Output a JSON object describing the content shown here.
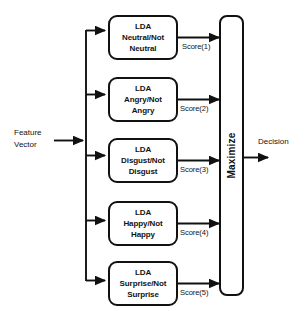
{
  "diagram": {
    "background_color": "#ffffff",
    "line_color": "#111111",
    "text_color": "#131313",
    "input": {
      "label_line1": "Feature",
      "label_line2": "Vector"
    },
    "classifiers": [
      {
        "name": "lda-neutral",
        "line1": "LDA",
        "line2": "Neutral/Not",
        "line3": "Neutral",
        "score_label": "Score(1)"
      },
      {
        "name": "lda-angry",
        "line1": "LDA",
        "line2": "Angry/Not",
        "line3": "Angry",
        "score_label": "Score(2)"
      },
      {
        "name": "lda-disgust",
        "line1": "LDA",
        "line2": "Disgust/Not",
        "line3": "Disgust",
        "score_label": "Score(3)"
      },
      {
        "name": "lda-happy",
        "line1": "LDA",
        "line2": "Happy/Not",
        "line3": "Happy",
        "score_label": "Score(4)"
      },
      {
        "name": "lda-surprise",
        "line1": "LDA",
        "line2": "Surprise/Not",
        "line3": "Surprise",
        "score_label": "Score(5)"
      }
    ],
    "combiner": {
      "label": "Maximize"
    },
    "output": {
      "label": "Decision"
    }
  }
}
